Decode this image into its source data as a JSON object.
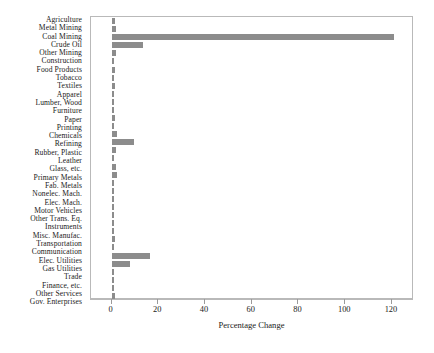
{
  "chart_data": {
    "type": "bar",
    "orientation": "horizontal",
    "title": "",
    "xlabel": "Percentage Change",
    "ylabel": "",
    "xlim": [
      0,
      129
    ],
    "xticks": [
      0,
      20,
      40,
      60,
      80,
      100,
      120
    ],
    "xticklabels": [
      "0",
      "20",
      "40",
      "60",
      "80",
      "100",
      "120"
    ],
    "grid": false,
    "legend": null,
    "bar_color": "#8c8c8c",
    "frame_color": "#b9b9b9",
    "categories": [
      "Agriculture",
      "Metal Mining",
      "Coal Mining",
      "Crude Oil",
      "Other Mining",
      "Construction",
      "Food Products",
      "Tobacco",
      "Textiles",
      "Apparel",
      "Lumber, Wood",
      "Furniture",
      "Paper",
      "Printing",
      "Chemicals",
      "Refining",
      "Rubber, Plastic",
      "Leather",
      "Glass, etc.",
      "Primary Metals",
      "Fab. Metals",
      "Nonelec. Mach.",
      "Elec. Mach.",
      "Motor Vehicles",
      "Other Trans. Eq.",
      "Instruments",
      "Misc. Manufac.",
      "Transportation",
      "Communication",
      "Elec. Utilities",
      "Gas Utilities",
      "Trade",
      "Finance, etc.",
      "Other Services",
      "Gov. Enterprises"
    ],
    "values": [
      1.5,
      1.8,
      121.0,
      13.5,
      2.0,
      1.0,
      1.3,
      0.8,
      1.6,
      0.7,
      0.8,
      0.9,
      1.7,
      0.8,
      2.2,
      9.5,
      1.8,
      0.5,
      2.0,
      2.3,
      1.0,
      0.7,
      0.6,
      0.7,
      0.7,
      0.6,
      0.7,
      1.4,
      0.7,
      16.5,
      8.0,
      0.9,
      0.6,
      0.7,
      1.6
    ]
  }
}
